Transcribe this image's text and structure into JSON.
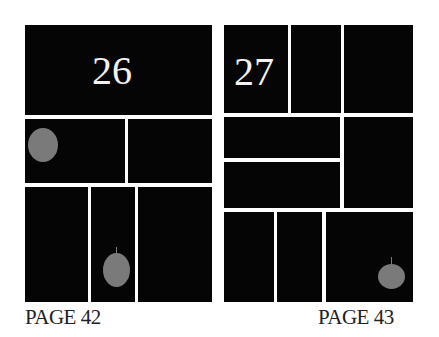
{
  "spread": {
    "left_page": {
      "page_number_panel": "26",
      "page_label": "PAGE 42"
    },
    "right_page": {
      "page_number_panel": "27",
      "page_label": "PAGE 43"
    }
  },
  "colors": {
    "panel": "#050505",
    "gutter": "#ffffff",
    "marker": "#7a7a7a"
  }
}
